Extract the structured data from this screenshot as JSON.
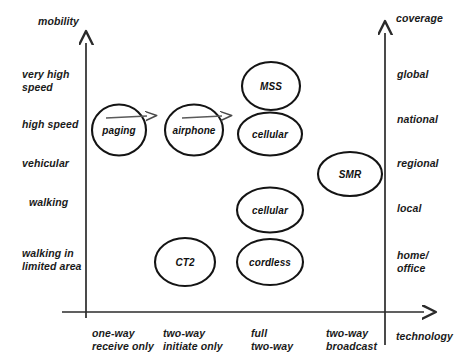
{
  "diagram": {
    "type": "scatter-positioning-map",
    "y_axis_left": {
      "title": "mobility",
      "labels": [
        "very high\nspeed",
        "high speed",
        "vehicular",
        "walking",
        "walking in\nlimited area"
      ]
    },
    "y_axis_right": {
      "title": "coverage",
      "labels": [
        "global",
        "national",
        "regional",
        "local",
        "home/\noffice"
      ]
    },
    "x_axis": {
      "title": "technology",
      "labels": [
        "one-way\nreceive only",
        "two-way\ninitiate only",
        "full\ntwo-way",
        "two-way\nbroadcast"
      ]
    },
    "nodes": [
      {
        "label": "paging",
        "x": "one-way receive only",
        "y": "high speed",
        "coverage": "national",
        "has_arrow": true
      },
      {
        "label": "airphone",
        "x": "two-way initiate only",
        "y": "high speed",
        "coverage": "national",
        "has_arrow": true
      },
      {
        "label": "MSS",
        "x": "full two-way",
        "y": "very high speed",
        "coverage": "global",
        "has_arrow": false
      },
      {
        "label": "cellular",
        "x": "full two-way",
        "y": "high speed",
        "coverage": "national",
        "has_arrow": false
      },
      {
        "label": "SMR",
        "x": "two-way broadcast",
        "y": "vehicular",
        "coverage": "regional",
        "has_arrow": false
      },
      {
        "label": "cellular",
        "x": "full two-way",
        "y": "walking",
        "coverage": "local",
        "has_arrow": false
      },
      {
        "label": "CT2",
        "x": "two-way initiate only",
        "y": "walking in limited area",
        "coverage": "home/office",
        "has_arrow": false
      },
      {
        "label": "cordless",
        "x": "full two-way",
        "y": "walking in limited area",
        "coverage": "home/office",
        "has_arrow": false
      }
    ],
    "colors": {
      "ink": "#111111",
      "axis": "#3a3a3a",
      "arrow_accent": "#555555",
      "background": "#ffffff"
    }
  }
}
